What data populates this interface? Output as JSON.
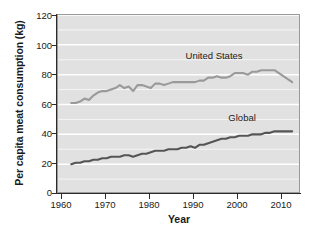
{
  "chart_data": {
    "type": "line",
    "title": "",
    "xlabel": "Year",
    "ylabel": "Per capita meat consumption (kg)",
    "xlim": [
      1958,
      2013
    ],
    "ylim": [
      0,
      120
    ],
    "grid": "horizontal-white-every-10",
    "legend_position": "inline-labels",
    "background": "#e1e1e1",
    "xticks": [
      1960,
      1970,
      1980,
      1990,
      2000,
      2010
    ],
    "yticks": [
      0,
      20,
      40,
      60,
      80,
      100,
      120
    ],
    "x": [
      1961,
      1962,
      1963,
      1964,
      1965,
      1966,
      1967,
      1968,
      1969,
      1970,
      1971,
      1972,
      1973,
      1974,
      1975,
      1976,
      1977,
      1978,
      1979,
      1980,
      1981,
      1982,
      1983,
      1984,
      1985,
      1986,
      1987,
      1988,
      1989,
      1990,
      1991,
      1992,
      1993,
      1994,
      1995,
      1996,
      1997,
      1998,
      1999,
      2000,
      2001,
      2002,
      2003,
      2004,
      2005,
      2006,
      2007,
      2008,
      2009,
      2010,
      2011
    ],
    "series": [
      {
        "name": "United States",
        "color": "#9a9a9a",
        "label_x": 2000,
        "label_y": 92,
        "values": [
          61,
          61,
          62,
          64,
          63,
          66,
          68,
          69,
          69,
          70,
          71,
          73,
          71,
          72,
          69,
          73,
          73,
          72,
          71,
          74,
          74,
          73,
          74,
          75,
          75,
          75,
          75,
          75,
          75,
          76,
          76,
          78,
          78,
          79,
          78,
          78,
          79,
          81,
          81,
          81,
          80,
          82,
          82,
          83,
          83,
          83,
          83,
          81,
          79,
          77,
          75
        ]
      },
      {
        "name": "Global",
        "color": "#555555",
        "label_x": 2003,
        "label_y": 50,
        "values": [
          20,
          21,
          21,
          22,
          22,
          23,
          23,
          24,
          24,
          25,
          25,
          25,
          26,
          26,
          25,
          26,
          27,
          27,
          28,
          29,
          29,
          29,
          30,
          30,
          30,
          31,
          31,
          32,
          31,
          33,
          33,
          34,
          35,
          36,
          37,
          37,
          38,
          38,
          39,
          39,
          39,
          40,
          40,
          40,
          41,
          41,
          42,
          42,
          42,
          42,
          42
        ]
      }
    ]
  },
  "axis": {
    "ytick_labels": [
      "120",
      "100",
      "80",
      "60",
      "40",
      "20",
      "0"
    ],
    "xtick_labels": [
      "1960",
      "1970",
      "1980",
      "1990",
      "2000",
      "2010"
    ],
    "ylabel": "Per capita meat consumption (kg)",
    "xlabel": "Year"
  },
  "caption": {
    "text": ""
  }
}
